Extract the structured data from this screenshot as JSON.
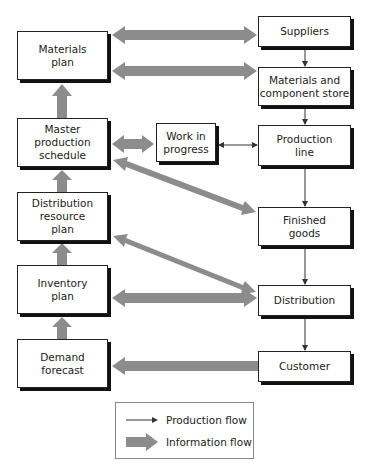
{
  "colors": {
    "info_arrow": "#8c8c8c",
    "production_arrow": "#333333",
    "box_border": "#222222",
    "box_shadow": "#111111"
  },
  "planning_boxes": [
    {
      "id": "materials-plan",
      "label": "Materials\nplan"
    },
    {
      "id": "master-production-schedule",
      "label": "Master\nproduction\nschedule"
    },
    {
      "id": "distribution-resource-plan",
      "label": "Distribution\nresource\nplan"
    },
    {
      "id": "inventory-plan",
      "label": "Inventory\nplan"
    },
    {
      "id": "demand-forecast",
      "label": "Demand\nforecast"
    }
  ],
  "physical_boxes": [
    {
      "id": "suppliers",
      "label": "Suppliers"
    },
    {
      "id": "materials-component-store",
      "label": "Materials and\ncomponent store"
    },
    {
      "id": "production-line",
      "label": "Production\nline"
    },
    {
      "id": "finished-goods",
      "label": "Finished\ngoods"
    },
    {
      "id": "distribution",
      "label": "Distribution"
    },
    {
      "id": "customer",
      "label": "Customer"
    }
  ],
  "middle_box": {
    "id": "work-in-progress",
    "label": "Work in\nprogress"
  },
  "information_flows": [
    {
      "from": "Demand forecast",
      "to": "Inventory plan",
      "type": "information"
    },
    {
      "from": "Inventory plan",
      "to": "Distribution resource plan",
      "type": "information"
    },
    {
      "from": "Distribution resource plan",
      "to": "Master production schedule",
      "type": "information"
    },
    {
      "from": "Master production schedule",
      "to": "Materials plan",
      "type": "information"
    },
    {
      "from": "Materials plan",
      "to": "Suppliers",
      "type": "information",
      "bidirectional": true
    },
    {
      "from": "Materials plan",
      "to": "Materials and component store",
      "type": "information",
      "bidirectional": true
    },
    {
      "from": "Master production schedule",
      "to": "Work in progress",
      "type": "information",
      "bidirectional": true
    },
    {
      "from": "Master production schedule",
      "to": "Finished goods",
      "type": "information",
      "bidirectional": true
    },
    {
      "from": "Distribution resource plan",
      "to": "Distribution",
      "type": "information",
      "bidirectional": true
    },
    {
      "from": "Inventory plan",
      "to": "Distribution",
      "type": "information",
      "bidirectional": true
    },
    {
      "from": "Customer",
      "to": "Demand forecast",
      "type": "information"
    }
  ],
  "production_flows": [
    {
      "from": "Suppliers",
      "to": "Materials and component store"
    },
    {
      "from": "Materials and component store",
      "to": "Production line"
    },
    {
      "from": "Work in progress",
      "to": "Production line",
      "bidirectional": true
    },
    {
      "from": "Production line",
      "to": "Finished goods"
    },
    {
      "from": "Finished goods",
      "to": "Distribution"
    },
    {
      "from": "Distribution",
      "to": "Customer"
    }
  ],
  "legend": {
    "production_flow_label": "Production flow",
    "information_flow_label": "Information flow"
  }
}
